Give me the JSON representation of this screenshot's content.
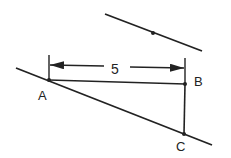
{
  "diagram": {
    "dimension_label": "5",
    "points": {
      "A": {
        "label": "A"
      },
      "B": {
        "label": "B"
      },
      "C": {
        "label": "C"
      }
    },
    "colors": {
      "stroke": "#222222",
      "background": "#ffffff"
    }
  }
}
